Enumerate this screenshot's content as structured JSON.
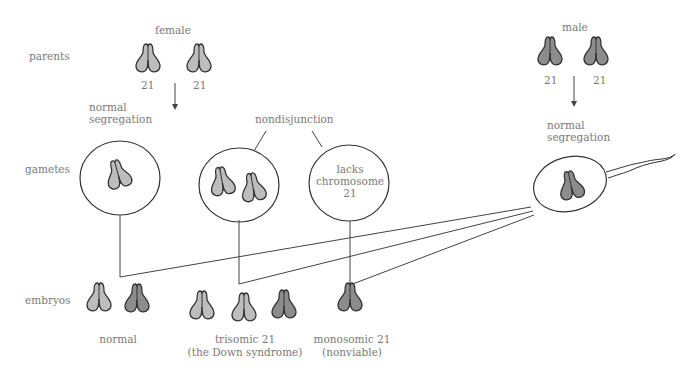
{
  "row_labels": {
    "parents": "parents",
    "gametes": "gametes",
    "embryos": "embryos"
  },
  "female": {
    "title": "female",
    "chromosome_labels": [
      "21",
      "21"
    ],
    "process": [
      "normal",
      "segregation"
    ]
  },
  "male": {
    "title": "male",
    "chromosome_labels": [
      "21",
      "21"
    ],
    "process": [
      "normal",
      "segregation"
    ]
  },
  "nondisjunction_label": "nondisjunction",
  "empty_gamete_text": [
    "lacks",
    "chromosome",
    "21"
  ],
  "outcomes": [
    {
      "line1": "normal",
      "line2": ""
    },
    {
      "line1": "trisomic 21",
      "line2": "(the Down syndrome)"
    },
    {
      "line1": "monosomic 21",
      "line2": "(nonviable)"
    }
  ],
  "colors": {
    "female_chromosome": "#bdbdbd",
    "male_chromosome": "#8c8c8c",
    "outline": "#333333",
    "text": "#7a7a7a",
    "line": "#444444"
  }
}
